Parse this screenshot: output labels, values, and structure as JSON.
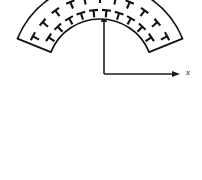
{
  "figure": {
    "background_color": "#ffffff",
    "line_color": "#111111",
    "width": 202,
    "height": 180
  },
  "axes": {
    "origin": {
      "x": 104,
      "y": 74
    },
    "x_axis": {
      "label": "x",
      "label_x": 186,
      "label_y": 75,
      "start_x": 104,
      "end_x": 178,
      "y": 74,
      "arrow": "right"
    },
    "y_axis": {
      "label": "y",
      "label_x": 101,
      "label_y": 11,
      "start_y": 74,
      "end_y": 16,
      "x": 104,
      "arrow": "up"
    }
  },
  "arch": {
    "name": "annular-sector",
    "center_x": 100,
    "center_y": 72,
    "inner_radius": 53,
    "outer_radius": 89,
    "start_angle_deg": 202,
    "end_angle_deg": 338,
    "fill": "#ffffff",
    "stroke": "#111111",
    "stroke_width": 1.7
  },
  "tacks": {
    "name": "radial-tack-markers",
    "glyph": "perpendicular-tack",
    "description": "T-shaped perpendicular symbols oriented radially outward",
    "bar_length": 9,
    "stem_length": 7,
    "stroke_width": 2.1,
    "rows": [
      {
        "name": "outer-row",
        "radius": 76,
        "count": 11,
        "angles_deg": [
          208,
          221,
          234,
          247,
          258,
          270,
          282,
          293,
          306,
          319,
          332
        ]
      },
      {
        "name": "inner-row",
        "radius": 62,
        "count": 10,
        "angles_deg": [
          214,
          227,
          240,
          252,
          264,
          276,
          288,
          300,
          313,
          326
        ]
      }
    ],
    "total_count": 21
  }
}
